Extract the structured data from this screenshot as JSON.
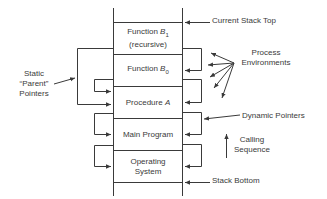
{
  "diagram": {
    "stack_frames": [
      {
        "name": "Function B1 (recursive)",
        "line1_prefix": "Function ",
        "var": "B",
        "sub": "1",
        "line2": "(recursive)"
      },
      {
        "name": "Function B0",
        "line1_prefix": "Function ",
        "var": "B",
        "sub": "0"
      },
      {
        "name": "Procedure A",
        "line1_prefix": "Procedure ",
        "var": "A"
      },
      {
        "name": "Main Program",
        "line1": "Main Program"
      },
      {
        "name": "Operating System",
        "line1": "Operating",
        "line2": "System"
      }
    ],
    "labels": {
      "current_stack_top": "Current Stack Top",
      "process_environments_line1": "Process",
      "process_environments_line2": "Environments",
      "static_parent_line1": "Static",
      "static_parent_line2": "“Parent”",
      "static_parent_line3": "Pointers",
      "dynamic_pointers": "Dynamic Pointers",
      "calling_sequence_line1": "Calling",
      "calling_sequence_line2": "Sequence",
      "stack_bottom": "Stack Bottom"
    },
    "colors": {
      "line": "#3a3a3a",
      "background": "#ffffff"
    }
  }
}
